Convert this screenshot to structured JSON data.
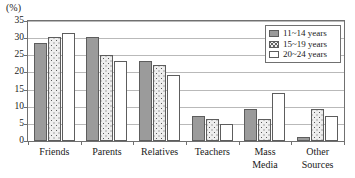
{
  "chart_data": {
    "type": "bar",
    "title": "",
    "subtitle": "",
    "xlabel": "",
    "ylabel": "(%)",
    "ylim": [
      0,
      35
    ],
    "yticks": [
      0,
      5,
      10,
      15,
      20,
      25,
      30,
      35
    ],
    "grid": true,
    "legend_position": "top-right",
    "categories": [
      "Friends",
      "Parents",
      "Relatives",
      "Teachers",
      "Mass\nMedia",
      "Other\nSources"
    ],
    "series": [
      {
        "name": "11~14 years",
        "values": [
          28.5,
          30.3,
          23.2,
          7.4,
          9.2,
          1.2
        ],
        "color": "#9b9b9b",
        "fill": "solid-gray"
      },
      {
        "name": "15~19 years",
        "values": [
          30.3,
          25.2,
          22.1,
          6.4,
          6.5,
          9.3
        ],
        "color": "#eeeeee",
        "fill": "dotted"
      },
      {
        "name": "20~24 years",
        "values": [
          31.5,
          23.3,
          19.2,
          5.1,
          13.9,
          7.3
        ],
        "color": "#ffffff",
        "fill": "white"
      }
    ]
  },
  "axis": {
    "unit_label": "(%)"
  },
  "legend": {
    "items": [
      {
        "label": "11~14 years"
      },
      {
        "label": "15~19 years"
      },
      {
        "label": "20~24 years"
      }
    ]
  },
  "colors": {
    "frame": "#707070",
    "grid": "#b9b9b9",
    "bar_outline": "#5d5d5d",
    "series_1": "#9b9b9b",
    "series_2": "#eeeeee",
    "series_3": "#ffffff",
    "text": "#1a1a1a"
  }
}
